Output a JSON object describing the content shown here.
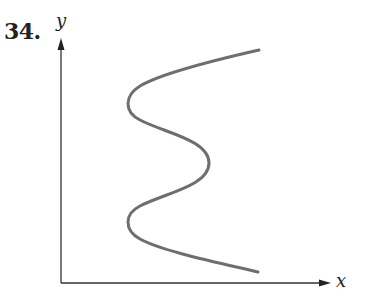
{
  "problem": {
    "number": "34."
  },
  "axes": {
    "x_label": "x",
    "y_label": "y"
  },
  "colors": {
    "axis": "#333333",
    "curve": "#6e6e6e",
    "text": "#222222"
  },
  "curve": {
    "description": "S-shaped curve opening to the right: starts upper right, bends left, bulges right, bends left again, ends lower right",
    "key_points": [
      {
        "name": "top-end",
        "x": 259,
        "y": 50
      },
      {
        "name": "upper-left-turn",
        "x": 130,
        "y": 103
      },
      {
        "name": "middle-right-bulge",
        "x": 209,
        "y": 163
      },
      {
        "name": "lower-left-turn",
        "x": 130,
        "y": 223
      },
      {
        "name": "bottom-end",
        "x": 258,
        "y": 272
      }
    ]
  }
}
